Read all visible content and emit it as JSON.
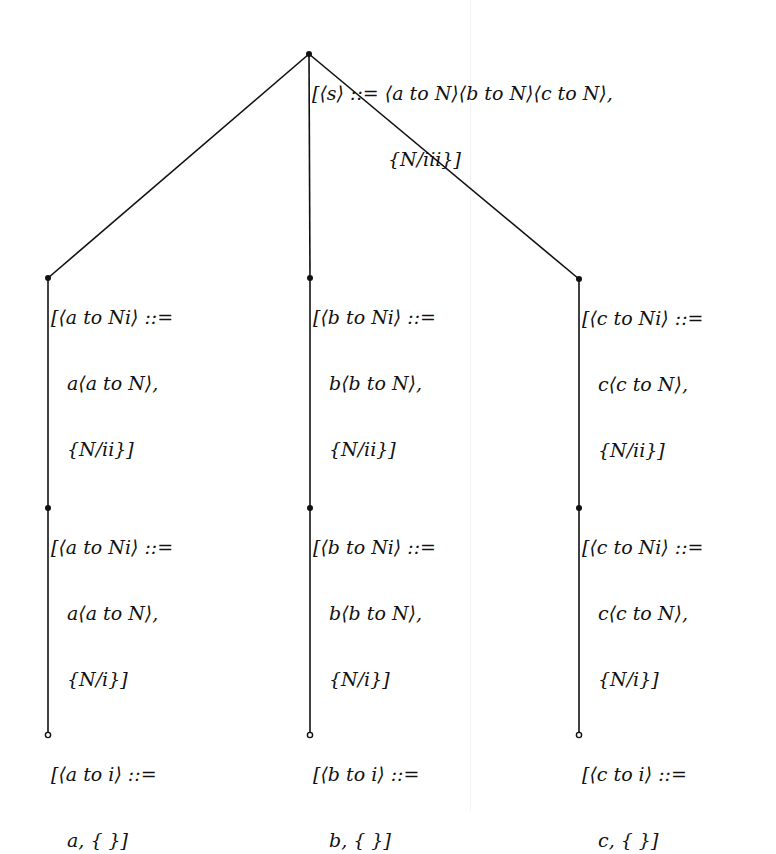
{
  "diagram": {
    "type": "tree",
    "colors": {
      "line": "#111111",
      "text": "#111111",
      "background": "#ffffff"
    },
    "nodes": [
      {
        "id": "root",
        "x": 309,
        "y": 54,
        "dot": "filled",
        "lines": [
          "[⟨s⟩ ::= ⟨a to N⟩⟨b to N⟩⟨c to N⟩,",
          "{N/iii}]"
        ]
      },
      {
        "id": "a2",
        "x": 48,
        "y": 278,
        "dot": "filled",
        "lines": [
          "[⟨a to Ni⟩ ::=",
          "a⟨a to N⟩,",
          "{N/ii}]"
        ]
      },
      {
        "id": "b2",
        "x": 310,
        "y": 278,
        "dot": "filled",
        "lines": [
          "[⟨b to Ni⟩ ::=",
          "b⟨b to N⟩,",
          "{N/ii}]"
        ]
      },
      {
        "id": "c2",
        "x": 579,
        "y": 279,
        "dot": "filled",
        "lines": [
          "[⟨c to Ni⟩ ::=",
          "c⟨c to N⟩,",
          "{N/ii}]"
        ]
      },
      {
        "id": "a1",
        "x": 48,
        "y": 508,
        "dot": "filled",
        "lines": [
          "[⟨a to Ni⟩ ::=",
          "a⟨a to N⟩,",
          "{N/i}]"
        ]
      },
      {
        "id": "b1",
        "x": 310,
        "y": 508,
        "dot": "filled",
        "lines": [
          "[⟨b to Ni⟩ ::=",
          "b⟨b to N⟩,",
          "{N/i}]"
        ]
      },
      {
        "id": "c1",
        "x": 579,
        "y": 508,
        "dot": "filled",
        "lines": [
          "[⟨c to Ni⟩ ::=",
          "c⟨c to N⟩,",
          "{N/i}]"
        ]
      },
      {
        "id": "a0",
        "x": 48,
        "y": 735,
        "dot": "hollow",
        "lines": [
          "[⟨a to i⟩ ::=",
          "a, { }]"
        ]
      },
      {
        "id": "b0",
        "x": 310,
        "y": 735,
        "dot": "hollow",
        "lines": [
          "[⟨b to i⟩ ::=",
          "b, { }]"
        ]
      },
      {
        "id": "c0",
        "x": 579,
        "y": 735,
        "dot": "hollow",
        "lines": [
          "[⟨c to i⟩ ::=",
          "c, { }]"
        ]
      }
    ],
    "edges": [
      [
        "root",
        "a2"
      ],
      [
        "root",
        "b2"
      ],
      [
        "root",
        "c2"
      ],
      [
        "a2",
        "a1"
      ],
      [
        "a1",
        "a0"
      ],
      [
        "b2",
        "b1"
      ],
      [
        "b1",
        "b0"
      ],
      [
        "c2",
        "c1"
      ],
      [
        "c1",
        "c0"
      ]
    ]
  }
}
